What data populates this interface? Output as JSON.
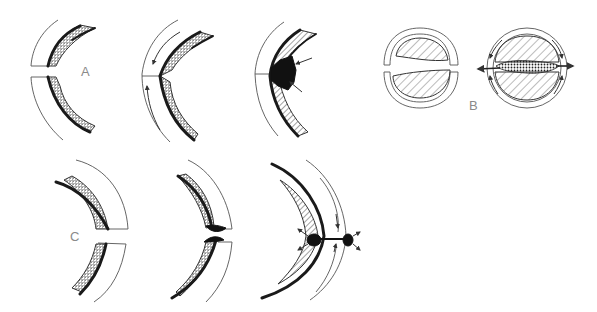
{
  "figure": {
    "type": "schematic medical illustration",
    "panels": {
      "A": {
        "label": "A",
        "stages": 3,
        "description": [
          "separated edges",
          "edges apposed with arrows indicating closure",
          "dark clot at junction with inward arrows"
        ]
      },
      "B": {
        "label": "B",
        "stages": 2,
        "description": [
          "two hatched halves separated",
          "halves joined with stippled central band and outward arrows"
        ]
      },
      "C": {
        "label": "C",
        "stages": 3,
        "description": [
          "separated edges",
          "edges with dark tips approaching",
          "joined with dark nodules and radiating arrows"
        ]
      }
    },
    "colors": {
      "ink": "#1a1a1a",
      "thin_line": "#555555",
      "label": "#8a8a8a",
      "background": "#ffffff"
    }
  }
}
